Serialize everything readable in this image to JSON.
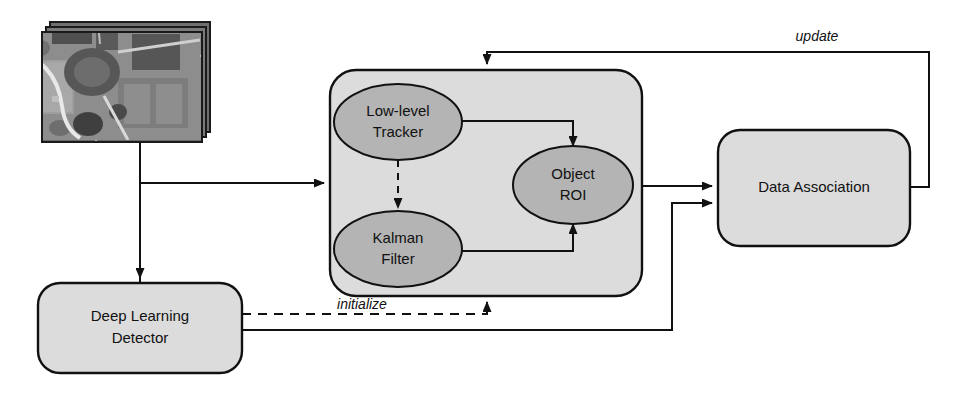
{
  "diagram": {
    "colors": {
      "module_fill": "#dcdcdc",
      "node_fill": "#b4b4b4",
      "box_fill": "#dcdcdc",
      "stroke": "#111111",
      "background": "#ffffff"
    },
    "input": {
      "name": "satellite-video-frames",
      "type": "image-stack",
      "description": "grayscale aerial satellite imagery frame stack"
    },
    "nodes": [
      {
        "id": "tracking_module",
        "label": "",
        "shape": "rounded-rect-container"
      },
      {
        "id": "low_level_tracker",
        "label_line1": "Low-level",
        "label_line2": "Tracker",
        "shape": "ellipse"
      },
      {
        "id": "kalman_filter",
        "label_line1": "Kalman",
        "label_line2": "Filter",
        "shape": "ellipse"
      },
      {
        "id": "object_roi",
        "label_line1": "Object",
        "label_line2": "ROI",
        "shape": "ellipse"
      },
      {
        "id": "deep_learning_detector",
        "label_line1": "Deep Learning",
        "label_line2": "Detector",
        "shape": "rounded-rect"
      },
      {
        "id": "data_association",
        "label_line1": "Data Association",
        "label_line2": "",
        "shape": "rounded-rect"
      }
    ],
    "edge_labels": {
      "update": "update",
      "initialize": "initialize"
    },
    "edges": [
      {
        "from": "satellite-video-frames",
        "to": "tracking_module",
        "style": "solid",
        "label": ""
      },
      {
        "from": "satellite-video-frames",
        "to": "deep_learning_detector",
        "style": "solid",
        "label": ""
      },
      {
        "from": "low_level_tracker",
        "to": "object_roi",
        "style": "solid",
        "label": ""
      },
      {
        "from": "low_level_tracker",
        "to": "kalman_filter",
        "style": "dashed",
        "label": ""
      },
      {
        "from": "kalman_filter",
        "to": "object_roi",
        "style": "solid",
        "label": ""
      },
      {
        "from": "tracking_module",
        "to": "data_association",
        "style": "solid",
        "label": ""
      },
      {
        "from": "deep_learning_detector",
        "to": "data_association",
        "style": "solid",
        "label": ""
      },
      {
        "from": "deep_learning_detector",
        "to": "tracking_module",
        "style": "dashed",
        "label": "initialize"
      },
      {
        "from": "data_association",
        "to": "tracking_module",
        "style": "solid",
        "label": "update"
      }
    ]
  }
}
